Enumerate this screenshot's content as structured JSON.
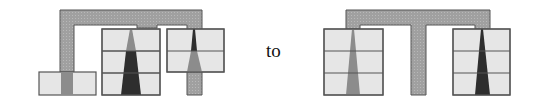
{
  "diagram": {
    "connector_word": "to",
    "colors": {
      "frame": "#a0a0a0",
      "cell": "#e6e6e6",
      "outline": "#555555",
      "wedge_light": "#8c8c8c",
      "wedge_dark": "#2e2e2e"
    },
    "before": {
      "description": "Left configuration: bracket frame joining a single low box, a 3-cell stack and a raised 2-cell stack"
    },
    "after": {
      "description": "Right configuration: T-shaped frame between two 3-cell stacks"
    }
  }
}
